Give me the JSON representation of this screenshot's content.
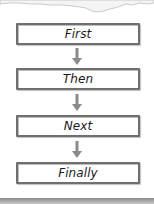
{
  "diagram": {
    "type": "sequence-flowchart",
    "steps": [
      {
        "label": "First"
      },
      {
        "label": "Then"
      },
      {
        "label": "Next"
      },
      {
        "label": "Finally"
      }
    ],
    "connectors": [
      "arrow-down",
      "arrow-down",
      "arrow-down"
    ],
    "colors": {
      "box_border": "#6f6f6f",
      "box_fill": "#ffffff",
      "arrow": "#8a8a8a",
      "text": "#1a1a1a",
      "background": "#ffffff"
    }
  }
}
